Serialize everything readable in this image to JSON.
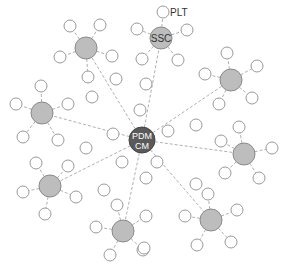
{
  "diagram": {
    "title": "",
    "colors": {
      "hub": "#5a5a5a",
      "hub_stroke": "#444444",
      "cluster": "#bdbdbd",
      "cluster_stroke": "#8a8a8a",
      "leaf_stroke": "#9a9a9a",
      "edge": "#b0b0b0",
      "hub_text": "#ffffff",
      "label_text": "#333333"
    },
    "hub": {
      "id": "pdm-cm",
      "label_line1": "PDM",
      "label_line2": "CM",
      "x": 142,
      "y": 140,
      "r": 13
    },
    "clusters": [
      {
        "id": "ssc",
        "label": "SSC",
        "x": 161,
        "y": 38,
        "r": 11,
        "leaves": [
          {
            "x": 163,
            "y": 12,
            "label": "PLT"
          },
          {
            "x": 187,
            "y": 30
          },
          {
            "x": 178,
            "y": 60
          },
          {
            "x": 142,
            "y": 59
          },
          {
            "x": 137,
            "y": 29
          }
        ]
      },
      {
        "id": "top-left",
        "label": "",
        "x": 86,
        "y": 48,
        "r": 11,
        "leaves": [
          {
            "x": 70,
            "y": 26
          },
          {
            "x": 100,
            "y": 25
          },
          {
            "x": 112,
            "y": 56
          },
          {
            "x": 88,
            "y": 77
          },
          {
            "x": 60,
            "y": 57
          }
        ]
      },
      {
        "id": "left",
        "label": "",
        "x": 42,
        "y": 113,
        "r": 11,
        "leaves": [
          {
            "x": 41,
            "y": 86
          },
          {
            "x": 68,
            "y": 104
          },
          {
            "x": 58,
            "y": 140
          },
          {
            "x": 23,
            "y": 137
          },
          {
            "x": 16,
            "y": 104
          }
        ]
      },
      {
        "id": "lower-left",
        "label": "",
        "x": 50,
        "y": 186,
        "r": 11,
        "leaves": [
          {
            "x": 36,
            "y": 163
          },
          {
            "x": 68,
            "y": 166
          },
          {
            "x": 76,
            "y": 197
          },
          {
            "x": 45,
            "y": 214
          },
          {
            "x": 23,
            "y": 192
          }
        ]
      },
      {
        "id": "bottom",
        "label": "",
        "x": 123,
        "y": 231,
        "r": 11,
        "leaves": [
          {
            "x": 117,
            "y": 205
          },
          {
            "x": 146,
            "y": 216
          },
          {
            "x": 143,
            "y": 250
          },
          {
            "x": 110,
            "y": 255
          },
          {
            "x": 96,
            "y": 227
          }
        ]
      },
      {
        "id": "bottom-right",
        "label": "",
        "x": 211,
        "y": 220,
        "r": 11,
        "leaves": [
          {
            "x": 208,
            "y": 194
          },
          {
            "x": 237,
            "y": 210
          },
          {
            "x": 231,
            "y": 242
          },
          {
            "x": 197,
            "y": 245
          },
          {
            "x": 185,
            "y": 216
          }
        ]
      },
      {
        "id": "right",
        "label": "",
        "x": 244,
        "y": 154,
        "r": 11,
        "leaves": [
          {
            "x": 239,
            "y": 127
          },
          {
            "x": 272,
            "y": 148
          },
          {
            "x": 259,
            "y": 178
          },
          {
            "x": 225,
            "y": 173
          },
          {
            "x": 221,
            "y": 141
          }
        ]
      },
      {
        "id": "upper-right",
        "label": "",
        "x": 231,
        "y": 80,
        "r": 11,
        "leaves": [
          {
            "x": 227,
            "y": 53
          },
          {
            "x": 257,
            "y": 66
          },
          {
            "x": 252,
            "y": 98
          },
          {
            "x": 219,
            "y": 104
          },
          {
            "x": 205,
            "y": 74
          }
        ]
      }
    ],
    "hub_leaves": [
      {
        "x": 140,
        "y": 110
      },
      {
        "x": 168,
        "y": 131
      },
      {
        "x": 157,
        "y": 162
      },
      {
        "x": 122,
        "y": 162
      },
      {
        "x": 113,
        "y": 134
      }
    ],
    "stray_leaves": [
      {
        "x": 92,
        "y": 97
      },
      {
        "x": 116,
        "y": 79
      },
      {
        "x": 146,
        "y": 84
      },
      {
        "x": 196,
        "y": 125
      },
      {
        "x": 146,
        "y": 178
      },
      {
        "x": 104,
        "y": 190
      },
      {
        "x": 86,
        "y": 148
      },
      {
        "x": 196,
        "y": 184
      },
      {
        "x": 144,
        "y": 248
      }
    ]
  }
}
